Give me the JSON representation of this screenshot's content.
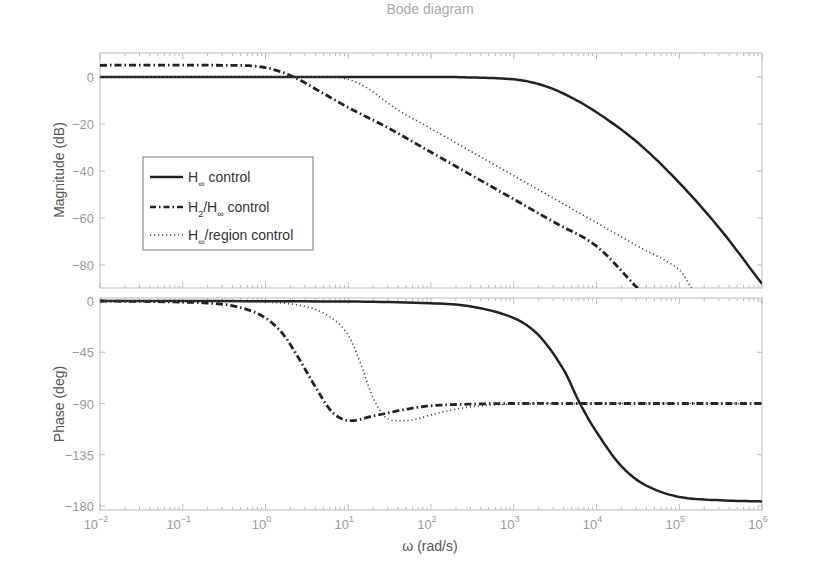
{
  "chart_data": {
    "type": "line",
    "title": "Bode diagram",
    "xlabel": "ω (rad/s)",
    "xscale": "log",
    "xlim": [
      0.01,
      1000000
    ],
    "x_tick_labels": [
      "10^-2",
      "10^-1",
      "10^0",
      "10^1",
      "10^2",
      "10^3",
      "10^4",
      "10^5",
      "10^6"
    ],
    "panels": [
      {
        "name": "magnitude",
        "ylabel": "Magnitude (dB)",
        "ylim": [
          -90,
          10
        ],
        "y_ticks": [
          0,
          -20,
          -40,
          -60,
          -80
        ],
        "series": [
          {
            "name": "H∞ control",
            "style": "solid",
            "log_x": [
              -2,
              2,
              2.5,
              3,
              3.3,
              3.6,
              4,
              4.5,
              5,
              5.5,
              6
            ],
            "values": [
              0,
              0,
              -0.2,
              -1,
              -3,
              -7,
              -15,
              -28,
              -45,
              -65,
              -88
            ]
          },
          {
            "name": "H2/H∞ control",
            "style": "dashdot",
            "log_x": [
              -2,
              -0.5,
              -0.2,
              0,
              0.2,
              0.4,
              0.6,
              0.8,
              1,
              1.5,
              2,
              2.5,
              3,
              3.5,
              4,
              4.5
            ],
            "values": [
              5,
              5,
              4.8,
              4,
              2,
              -1,
              -5,
              -9,
              -13,
              -22,
              -32,
              -42,
              -52,
              -62,
              -72,
              -90
            ]
          },
          {
            "name": "H∞/region control",
            "style": "dotted",
            "log_x": [
              -2,
              0.8,
              1,
              1.2,
              1.4,
              1.6,
              2,
              2.5,
              3,
              3.5,
              4,
              4.5,
              5,
              5.15
            ],
            "values": [
              0,
              0,
              -1,
              -4,
              -9,
              -14,
              -22,
              -32,
              -42,
              -52,
              -62,
              -72,
              -82,
              -90
            ]
          }
        ]
      },
      {
        "name": "phase",
        "ylabel": "Phase (deg)",
        "ylim": [
          -180,
          0
        ],
        "y_ticks": [
          0,
          -45,
          -90,
          -135,
          -180
        ],
        "series": [
          {
            "name": "H∞ control",
            "style": "solid",
            "log_x": [
              -2,
              1,
              2,
              2.5,
              3,
              3.3,
              3.6,
              3.8,
              4,
              4.3,
              4.6,
              5,
              5.5,
              6
            ],
            "values": [
              0,
              -0.5,
              -2,
              -5,
              -15,
              -30,
              -60,
              -90,
              -115,
              -145,
              -162,
              -172,
              -175,
              -176
            ]
          },
          {
            "name": "H2/H∞ control",
            "style": "dashdot",
            "log_x": [
              -2,
              -1,
              -0.5,
              -0.2,
              0,
              0.2,
              0.4,
              0.6,
              0.8,
              1,
              1.3,
              1.7,
              2,
              2.5,
              3,
              4,
              5,
              6
            ],
            "values": [
              0,
              -1,
              -3,
              -8,
              -15,
              -28,
              -50,
              -75,
              -97,
              -105,
              -101,
              -95,
              -92,
              -90.5,
              -90,
              -90,
              -90,
              -90
            ]
          },
          {
            "name": "H∞/region control",
            "style": "dotted",
            "log_x": [
              -2,
              0,
              0.5,
              0.8,
              1,
              1.15,
              1.3,
              1.45,
              1.6,
              1.8,
              2,
              2.3,
              2.6,
              3,
              3.5,
              6
            ],
            "values": [
              0,
              -1,
              -5,
              -15,
              -30,
              -55,
              -85,
              -102,
              -105,
              -104,
              -100,
              -95,
              -92,
              -90.5,
              -90,
              -90
            ]
          }
        ]
      }
    ],
    "legend": {
      "position": "upper-left inside magnitude panel",
      "entries": [
        {
          "main": "H",
          "sub": "∞",
          "rest": " control",
          "style": "solid"
        },
        {
          "main": "H",
          "sub": "2",
          "mid": "/H",
          "sub2": "∞",
          "rest": " control",
          "style": "dashdot"
        },
        {
          "main": "H",
          "sub": "∞",
          "rest": "/region control",
          "style": "dotted"
        }
      ]
    },
    "grid": false,
    "colors": {
      "line": "#222222",
      "axis": "#aaaaaa",
      "text": "#999999"
    }
  }
}
